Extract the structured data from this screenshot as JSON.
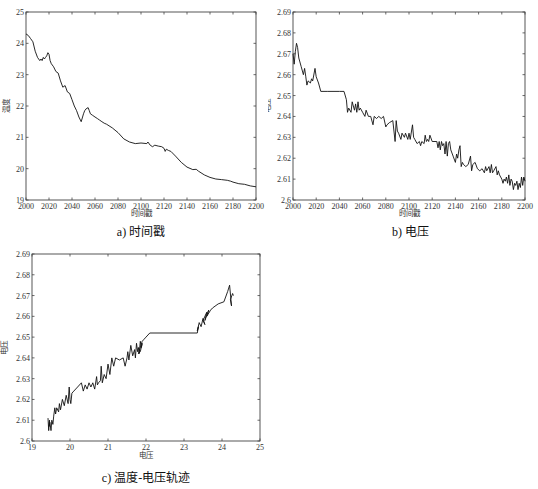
{
  "chart_data": [
    {
      "id": "a",
      "type": "line",
      "title": "",
      "caption": "a) 时间戳",
      "xlabel": "时间戳",
      "ylabel": "温度",
      "xlim": [
        2000,
        2200
      ],
      "ylim": [
        19,
        25
      ],
      "xticks": [
        2000,
        2020,
        2040,
        2060,
        2080,
        2100,
        2120,
        2140,
        2160,
        2180,
        2200
      ],
      "yticks": [
        19,
        20,
        21,
        22,
        23,
        24,
        25
      ],
      "grid": false,
      "series": [
        {
          "name": "温度",
          "x": [
            2000,
            2002,
            2004,
            2006,
            2008,
            2010,
            2012,
            2013,
            2014,
            2015,
            2016,
            2017,
            2018,
            2019,
            2020,
            2021,
            2022,
            2024,
            2026,
            2028,
            2030,
            2032,
            2034,
            2036,
            2038,
            2040,
            2042,
            2044,
            2046,
            2048,
            2050,
            2051,
            2052,
            2054,
            2055,
            2056,
            2058,
            2060,
            2062,
            2064,
            2066,
            2068,
            2070,
            2075,
            2080,
            2085,
            2090,
            2095,
            2100,
            2105,
            2106,
            2108,
            2110,
            2112,
            2115,
            2118,
            2120,
            2121,
            2122,
            2124,
            2126,
            2130,
            2135,
            2140,
            2145,
            2148,
            2150,
            2155,
            2160,
            2165,
            2170,
            2175,
            2178,
            2180,
            2185,
            2190,
            2195,
            2200
          ],
          "y": [
            24.3,
            24.25,
            24.15,
            24.05,
            23.75,
            23.55,
            23.45,
            23.5,
            23.45,
            23.55,
            23.5,
            23.55,
            23.6,
            23.7,
            23.65,
            23.45,
            23.35,
            23.25,
            23.1,
            23.05,
            22.8,
            22.6,
            22.65,
            22.45,
            22.4,
            22.2,
            22.0,
            21.85,
            21.65,
            21.5,
            21.75,
            21.85,
            21.9,
            21.95,
            21.85,
            21.75,
            21.7,
            21.65,
            21.6,
            21.55,
            21.5,
            21.45,
            21.42,
            21.3,
            21.15,
            20.95,
            20.85,
            20.8,
            20.82,
            20.8,
            20.85,
            20.75,
            20.7,
            20.75,
            20.72,
            20.7,
            20.65,
            20.55,
            20.62,
            20.58,
            20.55,
            20.4,
            20.2,
            20.05,
            19.97,
            19.98,
            19.92,
            19.8,
            19.72,
            19.67,
            19.65,
            19.63,
            19.6,
            19.57,
            19.52,
            19.5,
            19.45,
            19.42
          ]
        }
      ]
    },
    {
      "id": "b",
      "type": "line",
      "title": "",
      "caption": "b) 电压",
      "xlabel": "时间戳",
      "ylabel": "电压",
      "xlim": [
        2000,
        2200
      ],
      "ylim": [
        2.6,
        2.69
      ],
      "xticks": [
        2000,
        2020,
        2040,
        2060,
        2080,
        2100,
        2120,
        2140,
        2160,
        2180,
        2200
      ],
      "yticks": [
        2.6,
        2.61,
        2.62,
        2.63,
        2.64,
        2.65,
        2.66,
        2.67,
        2.68,
        2.69
      ],
      "grid": false,
      "series": [
        {
          "name": "电压",
          "x": [
            2000,
            2001,
            2002,
            2003,
            2004,
            2005,
            2007,
            2009,
            2010,
            2011,
            2012,
            2013,
            2015,
            2016,
            2017,
            2019,
            2020,
            2022,
            2024,
            2030,
            2040,
            2044,
            2046,
            2047,
            2048,
            2050,
            2051,
            2052,
            2053,
            2054,
            2055,
            2056,
            2057,
            2058,
            2060,
            2062,
            2063,
            2065,
            2067,
            2069,
            2070,
            2072,
            2074,
            2076,
            2078,
            2080,
            2081,
            2083,
            2086,
            2088,
            2089,
            2090,
            2091,
            2093,
            2094,
            2096,
            2097,
            2099,
            2100,
            2101,
            2103,
            2104,
            2105,
            2107,
            2109,
            2110,
            2111,
            2113,
            2114,
            2115,
            2116,
            2117,
            2118,
            2120,
            2124,
            2125,
            2126,
            2127,
            2128,
            2129,
            2130,
            2131,
            2132,
            2133,
            2134,
            2135,
            2136,
            2138,
            2140,
            2141,
            2142,
            2143,
            2144,
            2145,
            2146,
            2147,
            2149,
            2151,
            2153,
            2154,
            2155,
            2157,
            2159,
            2161,
            2163,
            2165,
            2166,
            2167,
            2169,
            2170,
            2171,
            2172,
            2173,
            2175,
            2176,
            2177,
            2178,
            2180,
            2181,
            2182,
            2183,
            2184,
            2185,
            2186,
            2187,
            2188,
            2189,
            2190,
            2191,
            2192,
            2193,
            2194,
            2195,
            2196,
            2197,
            2198,
            2199,
            2200
          ],
          "y": [
            2.67,
            2.665,
            2.671,
            2.675,
            2.673,
            2.668,
            2.664,
            2.66,
            2.663,
            2.659,
            2.655,
            2.657,
            2.656,
            2.658,
            2.657,
            2.663,
            2.659,
            2.656,
            2.652,
            2.652,
            2.652,
            2.652,
            2.648,
            2.642,
            2.644,
            2.642,
            2.647,
            2.645,
            2.643,
            2.646,
            2.642,
            2.647,
            2.643,
            2.644,
            2.642,
            2.64,
            2.643,
            2.64,
            2.64,
            2.636,
            2.64,
            2.639,
            2.64,
            2.639,
            2.64,
            2.635,
            2.636,
            2.637,
            2.638,
            2.628,
            2.638,
            2.633,
            2.632,
            2.629,
            2.632,
            2.63,
            2.632,
            2.629,
            2.632,
            2.629,
            2.636,
            2.63,
            2.629,
            2.627,
            2.628,
            2.626,
            2.628,
            2.627,
            2.631,
            2.628,
            2.629,
            2.628,
            2.631,
            2.628,
            2.628,
            2.625,
            2.628,
            2.624,
            2.628,
            2.626,
            2.627,
            2.622,
            2.628,
            2.621,
            2.627,
            2.628,
            2.624,
            2.621,
            2.618,
            2.622,
            2.62,
            2.624,
            2.626,
            2.616,
            2.618,
            2.617,
            2.616,
            2.617,
            2.621,
            2.614,
            2.617,
            2.618,
            2.615,
            2.614,
            2.615,
            2.613,
            2.616,
            2.614,
            2.616,
            2.613,
            2.617,
            2.613,
            2.614,
            2.616,
            2.612,
            2.614,
            2.612,
            2.61,
            2.608,
            2.61,
            2.609,
            2.611,
            2.608,
            2.612,
            2.607,
            2.61,
            2.609,
            2.605,
            2.608,
            2.607,
            2.609,
            2.605,
            2.608,
            2.606,
            2.611,
            2.607,
            2.611,
            2.609
          ]
        }
      ]
    },
    {
      "id": "c",
      "type": "line",
      "title": "",
      "caption": "c) 温度-电压轨迹",
      "xlabel": "电压",
      "ylabel": "电压",
      "xlim": [
        19,
        25
      ],
      "ylim": [
        2.6,
        2.69
      ],
      "xticks": [
        19,
        20,
        21,
        22,
        23,
        24,
        25
      ],
      "yticks": [
        2.6,
        2.61,
        2.62,
        2.63,
        2.64,
        2.65,
        2.66,
        2.67,
        2.68,
        2.69
      ],
      "grid": false,
      "series": [
        {
          "name": "温度-电压轨迹",
          "x": [
            19.42,
            19.44,
            19.46,
            19.45,
            19.47,
            19.5,
            19.52,
            19.55,
            19.57,
            19.6,
            19.62,
            19.65,
            19.7,
            19.72,
            19.75,
            19.8,
            19.85,
            19.9,
            19.95,
            19.98,
            20.0,
            20.02,
            20.05,
            20.1,
            20.2,
            20.3,
            20.35,
            20.4,
            20.45,
            20.5,
            20.55,
            20.6,
            20.65,
            20.7,
            20.72,
            20.75,
            20.8,
            20.82,
            20.85,
            20.9,
            20.95,
            21.0,
            21.05,
            21.1,
            21.15,
            21.2,
            21.3,
            21.4,
            21.45,
            21.5,
            21.52,
            21.55,
            21.6,
            21.65,
            21.7,
            21.72,
            21.75,
            21.78,
            21.8,
            21.82,
            21.85,
            21.88,
            21.9,
            21.85,
            21.8,
            21.9,
            21.95,
            22.0,
            22.1,
            22.5,
            23.0,
            23.35,
            23.38,
            23.35,
            23.4,
            23.45,
            23.5,
            23.55,
            23.5,
            23.6,
            23.55,
            23.65,
            23.6,
            23.7,
            23.75,
            23.9,
            24.05,
            24.15,
            24.2,
            24.25,
            24.22,
            24.28,
            24.3
          ],
          "y": [
            2.611,
            2.605,
            2.61,
            2.607,
            2.609,
            2.605,
            2.61,
            2.608,
            2.612,
            2.616,
            2.613,
            2.616,
            2.614,
            2.618,
            2.615,
            2.62,
            2.617,
            2.622,
            2.618,
            2.626,
            2.62,
            2.618,
            2.623,
            2.624,
            2.626,
            2.628,
            2.624,
            2.627,
            2.625,
            2.628,
            2.626,
            2.628,
            2.625,
            2.631,
            2.627,
            2.628,
            2.629,
            2.636,
            2.628,
            2.632,
            2.63,
            2.637,
            2.632,
            2.64,
            2.636,
            2.64,
            2.639,
            2.64,
            2.636,
            2.64,
            2.643,
            2.639,
            2.646,
            2.641,
            2.644,
            2.64,
            2.647,
            2.643,
            2.645,
            2.642,
            2.648,
            2.645,
            2.647,
            2.643,
            2.642,
            2.648,
            2.649,
            2.65,
            2.652,
            2.652,
            2.652,
            2.652,
            2.655,
            2.653,
            2.657,
            2.655,
            2.659,
            2.656,
            2.658,
            2.662,
            2.658,
            2.663,
            2.66,
            2.663,
            2.664,
            2.666,
            2.667,
            2.672,
            2.675,
            2.665,
            2.668,
            2.671,
            2.67
          ]
        }
      ]
    }
  ],
  "captions": {
    "a": "a) 时间戳",
    "b": "b) 电压",
    "c": "c) 温度-电压轨迹"
  }
}
